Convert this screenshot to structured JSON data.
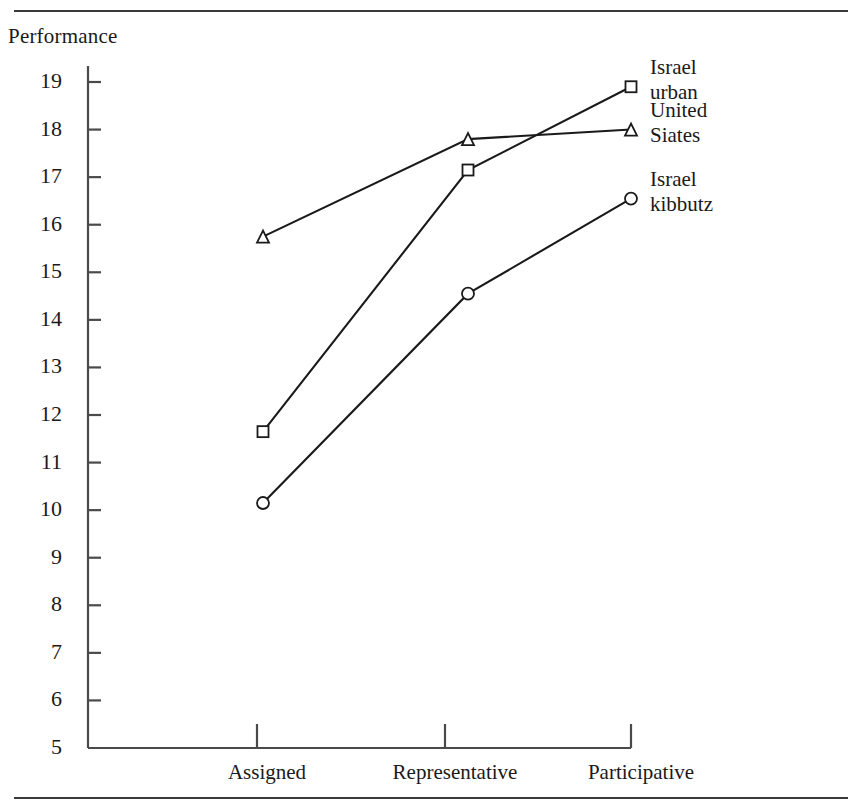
{
  "figure": {
    "axis_title": "Performance",
    "rules": {
      "top": "horizontal-rule",
      "bottom": "horizontal-rule"
    }
  },
  "chart_data": {
    "type": "line",
    "title": "",
    "subtitle": "",
    "xlabel": "",
    "ylabel": "Performance",
    "categories": [
      "Assigned",
      "Representative",
      "Participative"
    ],
    "ylim": [
      5,
      19
    ],
    "ytick_labels": [
      "19",
      "18",
      "17",
      "16",
      "15",
      "14",
      "13",
      "12",
      "11",
      "10",
      "9",
      "8",
      "7",
      "6",
      "5"
    ],
    "ytick_values": [
      19,
      18,
      17,
      16,
      15,
      14,
      13,
      12,
      11,
      10,
      9,
      8,
      7,
      6,
      5
    ],
    "grid": false,
    "legend_position": "right",
    "series": [
      {
        "name": "Israel urban",
        "label_lines": [
          "Israel",
          "urban"
        ],
        "marker": "square",
        "values": [
          11.65,
          17.15,
          18.9
        ]
      },
      {
        "name": "United Siates",
        "label_lines": [
          "United",
          "Siates"
        ],
        "marker": "triangle",
        "values": [
          15.75,
          17.8,
          18.0
        ]
      },
      {
        "name": "Israel kibbutz",
        "label_lines": [
          "Israel",
          "kibbutz"
        ],
        "marker": "circle",
        "values": [
          10.15,
          14.55,
          16.55
        ]
      }
    ],
    "colors": {
      "line": "#1a1a1a",
      "marker_fill": "#ffffff",
      "axis": "#4a4a4a"
    }
  }
}
